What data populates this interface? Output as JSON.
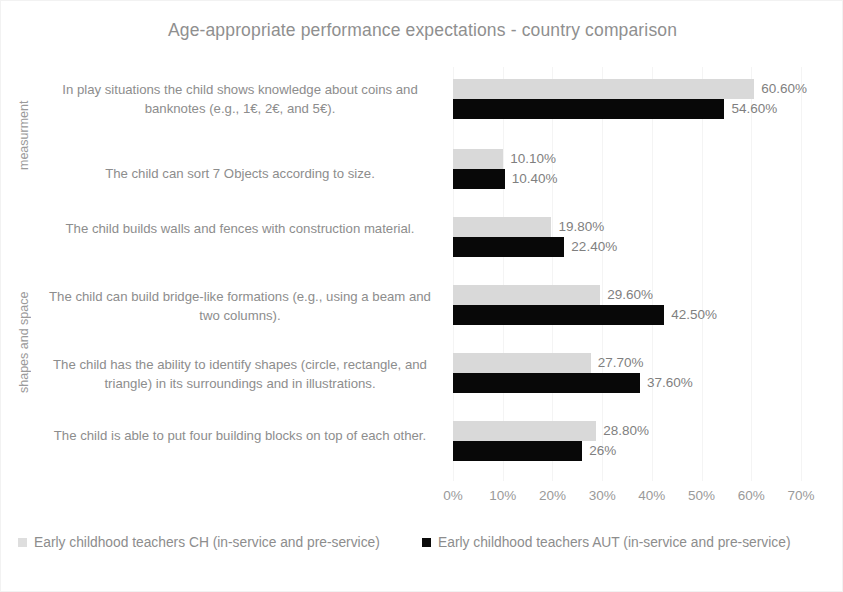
{
  "chart_data": {
    "type": "bar",
    "orientation": "horizontal",
    "title": "Age-appropriate performance expectations - country comparison",
    "xlabel": "",
    "ylabel": "",
    "xlim": [
      0,
      70
    ],
    "xticks": [
      "0%",
      "10%",
      "20%",
      "30%",
      "40%",
      "50%",
      "60%",
      "70%"
    ],
    "xtick_values": [
      0,
      10,
      20,
      30,
      40,
      50,
      60,
      70
    ],
    "grid": true,
    "legend_position": "bottom",
    "categories": [
      "In play situations the child shows knowledge about coins and banknotes (e.g., 1€, 2€, and 5€).",
      "The child can sort 7 Objects according to size.",
      "The child builds walls and fences with construction material.",
      "The child can build bridge-like formations (e.g., using a beam and two columns).",
      "The child has the ability to identify shapes (circle, rectangle, and triangle) in its surroundings and in illustrations.",
      "The child is able to put four building blocks on top of each other."
    ],
    "series": [
      {
        "name": "Early childhood teachers CH (in-service and pre-service)",
        "color": "#d9d9d9",
        "values": [
          60.6,
          10.1,
          19.8,
          29.6,
          27.7,
          28.8
        ],
        "labels": [
          "60.60%",
          "10.10%",
          "19.80%",
          "29.60%",
          "27.70%",
          "28.80%"
        ]
      },
      {
        "name": "Early childhood teachers AUT (in-service and pre-service)",
        "color": "#080808",
        "values": [
          54.6,
          10.4,
          22.4,
          42.5,
          37.6,
          26.0
        ],
        "labels": [
          "54.60%",
          "10.40%",
          "22.40%",
          "42.50%",
          "37.60%",
          "26%"
        ]
      }
    ],
    "group_axis_titles": [
      {
        "label": "measurment",
        "categories": [
          0,
          1
        ]
      },
      {
        "label": "shapes and space",
        "categories": [
          2,
          3,
          4,
          5
        ]
      }
    ]
  }
}
